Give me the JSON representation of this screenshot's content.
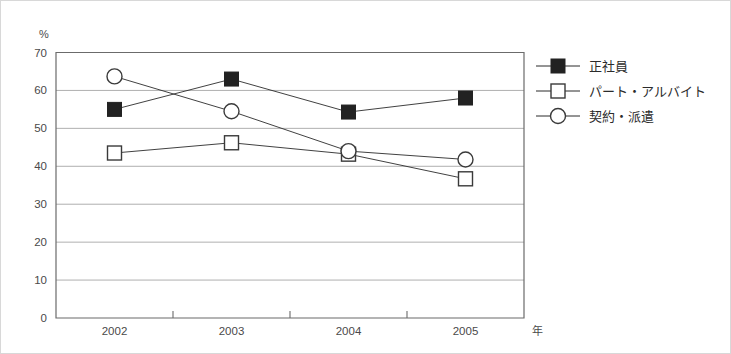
{
  "chart_data": {
    "type": "line",
    "title": "",
    "xlabel": "年",
    "ylabel": "%",
    "categories": [
      "2002",
      "2003",
      "2004",
      "2005"
    ],
    "ylim": [
      0,
      70
    ],
    "ytick_labels": [
      "0",
      "10",
      "20",
      "30",
      "40",
      "50",
      "60",
      "70"
    ],
    "ytick_values": [
      0,
      10,
      20,
      30,
      40,
      50,
      60,
      70
    ],
    "grid": true,
    "legend_position": "right",
    "series": [
      {
        "name": "正社員",
        "marker": "filled-square",
        "values": [
          55.0,
          63.0,
          54.3,
          58.0
        ]
      },
      {
        "name": "パート・アルバイト",
        "marker": "open-square",
        "values": [
          43.5,
          46.2,
          43.2,
          36.7
        ]
      },
      {
        "name": "契約・派遣",
        "marker": "open-circle",
        "values": [
          63.7,
          54.5,
          44.0,
          41.8
        ]
      }
    ]
  },
  "axes": {
    "y_unit_label": "%",
    "x_unit_label": "年"
  },
  "legend": {
    "entries": [
      {
        "label": "正社員",
        "marker": "filled-square"
      },
      {
        "label": "パート・アルバイト",
        "marker": "open-square"
      },
      {
        "label": "契約・派遣",
        "marker": "open-circle"
      }
    ]
  },
  "colors": {
    "marker_fill": "#222222",
    "marker_stroke": "#3a3a3a",
    "line": "#2b2b2b",
    "grid": "#9a9a9a",
    "axis": "#6b6b6b",
    "text": "#3a3a3a",
    "background": "#ffffff"
  }
}
